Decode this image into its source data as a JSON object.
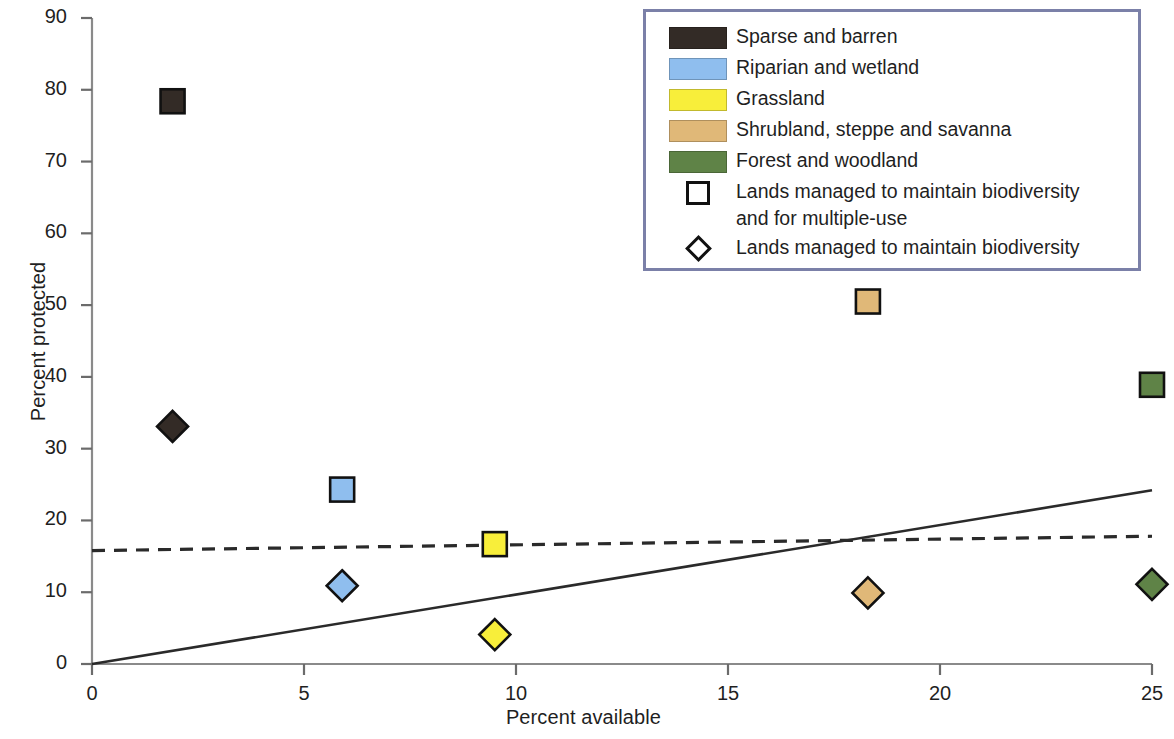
{
  "chart": {
    "type": "scatter",
    "title": "",
    "xlabel": "Percent available",
    "ylabel": "Percent protected"
  },
  "axes": {
    "x_ticks": [
      "0",
      "5",
      "10",
      "15",
      "20",
      "25"
    ],
    "y_ticks": [
      "0",
      "10",
      "20",
      "30",
      "40",
      "50",
      "60",
      "70",
      "80",
      "90"
    ],
    "xlim": [
      0,
      25
    ],
    "ylim": [
      0,
      90
    ],
    "grid": false
  },
  "legend": {
    "position": "top-right",
    "border_color": "#7b80a8",
    "entries": [
      {
        "label": "Sparse and barren",
        "key": "swatch",
        "color": "#332b26"
      },
      {
        "label": "Riparian and wetland",
        "key": "swatch",
        "color": "#8fbeee"
      },
      {
        "label": "Grassland",
        "key": "swatch",
        "color": "#f8ee3a"
      },
      {
        "label": "Shrubland, steppe and savanna",
        "key": "swatch",
        "color": "#e0b878"
      },
      {
        "label": "Forest and woodland",
        "key": "swatch",
        "color": "#5f8347"
      },
      {
        "label": "Lands managed to maintain biodiversity\nand for multiple-use",
        "key": "open-square",
        "color": "#ffffff"
      },
      {
        "label": "Lands managed to maintain biodiversity",
        "key": "open-diamond",
        "color": "#ffffff"
      }
    ]
  },
  "chart_data": {
    "type": "scatter",
    "title": "",
    "xlabel": "Percent available",
    "ylabel": "Percent protected",
    "xlim": [
      0,
      25
    ],
    "ylim": [
      0,
      90
    ],
    "xticks": [
      0,
      5,
      10,
      15,
      20,
      25
    ],
    "yticks": [
      0,
      10,
      20,
      30,
      40,
      50,
      60,
      70,
      80,
      90
    ],
    "grid": false,
    "legend_position": "top-right",
    "series": [
      {
        "name": "Lands managed to maintain biodiversity and for multiple-use",
        "marker": "square",
        "points": [
          {
            "category": "Sparse and barren",
            "color": "#332b26",
            "x": 1.9,
            "y": 78.4
          },
          {
            "category": "Riparian and wetland",
            "color": "#8fbeee",
            "x": 5.9,
            "y": 24.3
          },
          {
            "category": "Grassland",
            "color": "#f8ee3a",
            "x": 9.5,
            "y": 16.7
          },
          {
            "category": "Shrubland, steppe and savanna",
            "color": "#e0b878",
            "x": 18.3,
            "y": 50.5
          },
          {
            "category": "Forest and woodland",
            "color": "#5f8347",
            "x": 25.0,
            "y": 38.9
          }
        ]
      },
      {
        "name": "Lands managed to maintain biodiversity",
        "marker": "diamond",
        "points": [
          {
            "category": "Sparse and barren",
            "color": "#332b26",
            "x": 1.9,
            "y": 33.1
          },
          {
            "category": "Riparian and wetland",
            "color": "#8fbeee",
            "x": 5.9,
            "y": 10.9
          },
          {
            "category": "Grassland",
            "color": "#f8ee3a",
            "x": 9.5,
            "y": 4.1
          },
          {
            "category": "Shrubland, steppe and savanna",
            "color": "#e0b878",
            "x": 18.3,
            "y": 9.9
          },
          {
            "category": "Forest and woodland",
            "color": "#5f8347",
            "x": 25.0,
            "y": 11.1
          }
        ]
      }
    ],
    "trendlines": [
      {
        "name": "solid-trendline",
        "style": "solid",
        "x0": 0,
        "y0": 0,
        "x1": 25,
        "y1": 24.2
      },
      {
        "name": "dashed-trendline",
        "style": "dashed",
        "x0": 0,
        "y0": 15.8,
        "x1": 25,
        "y1": 17.8
      }
    ]
  }
}
